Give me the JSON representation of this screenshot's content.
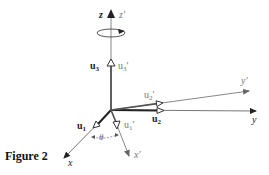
{
  "caption": "Figure 2",
  "axes": {
    "z": "z",
    "z_prime": "z′",
    "y": "y",
    "y_prime": "y′",
    "x": "x",
    "x_prime": "x′"
  },
  "vectors": {
    "u1": {
      "base": "u",
      "sub": "1"
    },
    "u1_prime": {
      "base": "u",
      "sub": "1",
      "prime": "′"
    },
    "u2": {
      "base": "u",
      "sub": "2"
    },
    "u2_prime": {
      "base": "u",
      "sub": "2",
      "prime": "′"
    },
    "u3": {
      "base": "u",
      "sub": "3"
    },
    "u3_prime": {
      "base": "u",
      "sub": "3",
      "prime": "′"
    }
  },
  "angle": "θ",
  "colors": {
    "original_axes": "#222222",
    "rotated_axes": "#777777"
  }
}
